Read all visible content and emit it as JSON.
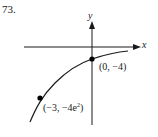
{
  "problem": {
    "number": "73."
  },
  "axes": {
    "x_label": "x",
    "y_label": "y"
  },
  "points": [
    {
      "label": "(0, −4)",
      "x": 0,
      "y": "-4"
    },
    {
      "label_prefix": "(−3, −4e",
      "label_sup": "2",
      "label_suffix": ")",
      "x": -3,
      "y": "-4e^2"
    }
  ],
  "colors": {
    "stroke": "#1a1a1a",
    "background": "#ffffff"
  }
}
